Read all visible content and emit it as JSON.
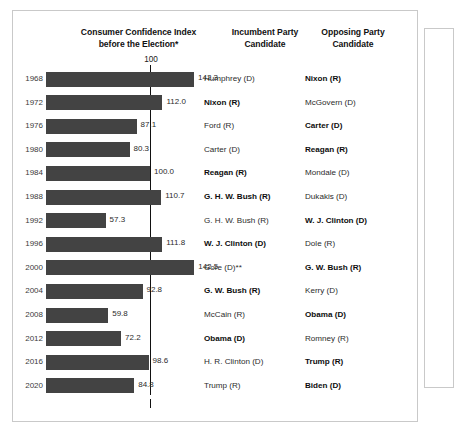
{
  "headers": {
    "chart_title_line1": "Consumer Confidence Index",
    "chart_title_line2": "before the Election*",
    "incumbent_line1": "Incumbent Party",
    "incumbent_line2": "Candidate",
    "opposing_line1": "Opposing Party",
    "opposing_line2": "Candidate"
  },
  "axis": {
    "reference_label": "100"
  },
  "colors": {
    "bar": "#434343",
    "reference_line": "#111111",
    "panel_border": "#c9c9c9",
    "text": "#2b2b2b"
  },
  "chart_data": {
    "type": "bar",
    "orientation": "horizontal",
    "title": "Consumer Confidence Index before the Election*",
    "xlabel": "",
    "ylabel": "",
    "xlim": [
      0,
      150
    ],
    "grid": false,
    "reference_line": 100,
    "legend": "none",
    "categories": [
      "1968",
      "1972",
      "1976",
      "1980",
      "1984",
      "1988",
      "1992",
      "1996",
      "2000",
      "2004",
      "2008",
      "2012",
      "2016",
      "2020"
    ],
    "values": [
      142.3,
      112.0,
      87.1,
      80.3,
      100.0,
      110.7,
      57.3,
      111.8,
      142.5,
      92.8,
      59.8,
      72.2,
      98.6,
      84.8
    ],
    "value_labels": [
      "142.3",
      "112.0",
      "87.1",
      "80.3",
      "100.0",
      "110.7",
      "57.3",
      "111.8",
      "142.5",
      "92.8",
      "59.8",
      "72.2",
      "98.6",
      "84.8"
    ],
    "annotations": {
      "footnote_markers": [
        "*",
        "**"
      ]
    }
  },
  "rows": [
    {
      "year": "1968",
      "value": 142.3,
      "value_label": "142.3",
      "incumbent": "Humphrey (D)",
      "incumbent_bold": false,
      "opposing": "Nixon (R)",
      "opposing_bold": true
    },
    {
      "year": "1972",
      "value": 112.0,
      "value_label": "112.0",
      "incumbent": "Nixon (R)",
      "incumbent_bold": true,
      "opposing": "McGovern (D)",
      "opposing_bold": false
    },
    {
      "year": "1976",
      "value": 87.1,
      "value_label": "87.1",
      "incumbent": "Ford (R)",
      "incumbent_bold": false,
      "opposing": "Carter (D)",
      "opposing_bold": true
    },
    {
      "year": "1980",
      "value": 80.3,
      "value_label": "80.3",
      "incumbent": "Carter (D)",
      "incumbent_bold": false,
      "opposing": "Reagan (R)",
      "opposing_bold": true
    },
    {
      "year": "1984",
      "value": 100.0,
      "value_label": "100.0",
      "incumbent": "Reagan (R)",
      "incumbent_bold": true,
      "opposing": "Mondale (D)",
      "opposing_bold": false
    },
    {
      "year": "1988",
      "value": 110.7,
      "value_label": "110.7",
      "incumbent": "G. H. W. Bush (R)",
      "incumbent_bold": true,
      "opposing": "Dukakis (D)",
      "opposing_bold": false
    },
    {
      "year": "1992",
      "value": 57.3,
      "value_label": "57.3",
      "incumbent": "G. H. W. Bush (R)",
      "incumbent_bold": false,
      "opposing": "W. J. Clinton (D)",
      "opposing_bold": true
    },
    {
      "year": "1996",
      "value": 111.8,
      "value_label": "111.8",
      "incumbent": "W. J. Clinton (D)",
      "incumbent_bold": true,
      "opposing": "Dole (R)",
      "opposing_bold": false
    },
    {
      "year": "2000",
      "value": 142.5,
      "value_label": "142.5",
      "incumbent": "Gore (D)**",
      "incumbent_bold": false,
      "opposing": "G. W. Bush (R)",
      "opposing_bold": true
    },
    {
      "year": "2004",
      "value": 92.8,
      "value_label": "92.8",
      "incumbent": "G. W. Bush (R)",
      "incumbent_bold": true,
      "opposing": "Kerry (D)",
      "opposing_bold": false
    },
    {
      "year": "2008",
      "value": 59.8,
      "value_label": "59.8",
      "incumbent": "McCain (R)",
      "incumbent_bold": false,
      "opposing": "Obama (D)",
      "opposing_bold": true
    },
    {
      "year": "2012",
      "value": 72.2,
      "value_label": "72.2",
      "incumbent": "Obama (D)",
      "incumbent_bold": true,
      "opposing": "Romney (R)",
      "opposing_bold": false
    },
    {
      "year": "2016",
      "value": 98.6,
      "value_label": "98.6",
      "incumbent": "H. R. Clinton (D)",
      "incumbent_bold": false,
      "opposing": "Trump (R)",
      "opposing_bold": true
    },
    {
      "year": "2020",
      "value": 84.8,
      "value_label": "84.8",
      "incumbent": "Trump (R)",
      "incumbent_bold": false,
      "opposing": "Biden (D)",
      "opposing_bold": true
    }
  ]
}
